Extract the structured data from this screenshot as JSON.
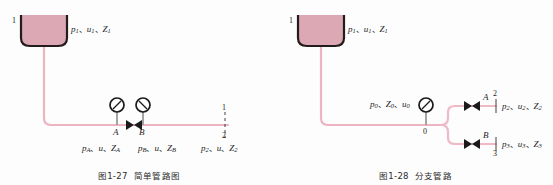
{
  "page": {
    "background_color": "#fdfdfd",
    "width": 553,
    "height": 185
  },
  "style": {
    "pipe_color": "#f0b9c6",
    "pipe_dark_color": "#e59fb1",
    "tank_fill_color": "#dba8b4",
    "tank_outline_color": "#241c1c",
    "gauge_outline_color": "#1a1a1a",
    "stem_color": "#9a9a9a",
    "text_color": "#1d1d1d"
  },
  "figures": [
    {
      "id": "simple-pipeline",
      "caption_number": "图1-27",
      "caption_title": "简单管路图",
      "tank": {
        "marker": "1",
        "label": "p₁、u₁、Z₁",
        "label_parts": {
          "p": "p",
          "p_sub": "1",
          "u": "u",
          "u_sub": "1",
          "z": "Z",
          "z_sub": "1"
        }
      },
      "gauges": [
        {
          "name": "gauge-a",
          "point_label": "A",
          "needle": "up-left"
        },
        {
          "name": "gauge-b",
          "point_label": "B",
          "needle": "up-right"
        }
      ],
      "valve": {
        "name": "valve-ab",
        "symbol": "bowtie"
      },
      "section_labels": [
        {
          "point": "A",
          "text": "p_A、u、Z_A",
          "p": "p",
          "p_sub": "A",
          "u": "u",
          "u_sub": "",
          "z": "Z",
          "z_sub": "A"
        },
        {
          "point": "B",
          "text": "p_B、u、Z_B",
          "p": "p",
          "p_sub": "B",
          "u": "u",
          "u_sub": "",
          "z": "Z",
          "z_sub": "B"
        },
        {
          "point": "2",
          "text": "p₂、u、Z₂",
          "p": "p",
          "p_sub": "2",
          "u": "u",
          "u_sub": "",
          "z": "Z",
          "z_sub": "2"
        }
      ],
      "outlet_section": {
        "top_marker": "1",
        "bottom_marker": "2"
      }
    },
    {
      "id": "branched-pipeline",
      "caption_number": "图1-28",
      "caption_title": "分支管路",
      "tank": {
        "marker": "1",
        "label": "p₁、u₁、Z₁",
        "label_parts": {
          "p": "p",
          "p_sub": "1",
          "u": "u",
          "u_sub": "1",
          "z": "Z",
          "z_sub": "1"
        }
      },
      "junction": {
        "marker": "0",
        "label": "p₀、Z₀、u₀",
        "label_parts": {
          "p": "p",
          "p_sub": "0",
          "z": "Z",
          "z_sub": "0",
          "u": "u",
          "u_sub": "0"
        }
      },
      "gauges": [
        {
          "name": "gauge-junction",
          "point_label": "0",
          "needle": "up-left"
        }
      ],
      "branches": [
        {
          "name": "branch-upper",
          "valve_label": "A",
          "end_marker": "2",
          "text": "p₂、u₂、Z₂",
          "p": "p",
          "p_sub": "2",
          "u": "u",
          "u_sub": "2",
          "z": "Z",
          "z_sub": "2"
        },
        {
          "name": "branch-lower",
          "valve_label": "B",
          "end_marker": "3",
          "text": "p₃、u₃、Z₃",
          "p": "p",
          "p_sub": "3",
          "u": "u",
          "u_sub": "3",
          "z": "Z",
          "z_sub": "3"
        }
      ]
    }
  ]
}
